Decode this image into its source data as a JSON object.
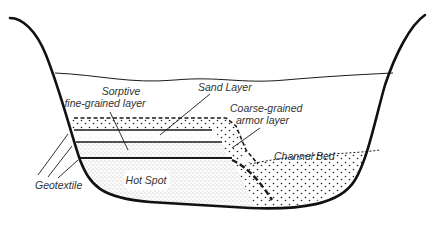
{
  "diagram": {
    "type": "cross-section",
    "labels": {
      "sorptive_line1": "Sorptive",
      "sorptive_line2": "fine-grained layer",
      "sand": "Sand Layer",
      "armor_line1": "Coarse-grained",
      "armor_line2": "armor layer",
      "channel_bed": "Channel Bed",
      "geotextile": "Geotextile",
      "hot_spot": "Hot Spot"
    },
    "colors": {
      "stroke": "#1a1a1a",
      "text": "#333333",
      "background": "#ffffff"
    }
  }
}
